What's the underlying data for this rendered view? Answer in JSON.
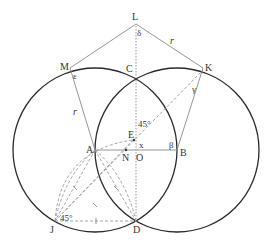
{
  "diagram": {
    "points": {
      "L": "L",
      "M": "M",
      "C": "C",
      "K": "K",
      "E": "E",
      "A": "A",
      "N": "N",
      "O": "O",
      "B": "B",
      "J": "J",
      "D": "D"
    },
    "angles": {
      "delta": "δ",
      "epsilon": "ε",
      "gamma": "γ",
      "beta": "β",
      "x": "x",
      "angle_45_top": "45°",
      "angle_45_bottom": "45°"
    },
    "segments": {
      "r_left": "r",
      "r_top": "r"
    },
    "colors": {
      "circle": "#2a2a2a",
      "line": "#8a8a8a",
      "dashed": "#9a9a9a"
    }
  }
}
